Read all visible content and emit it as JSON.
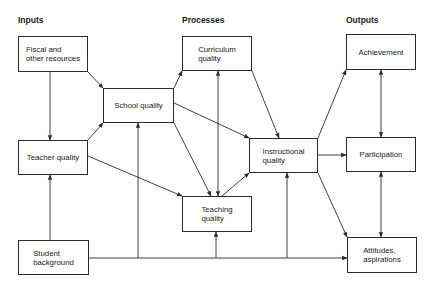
{
  "headers": {
    "inputs": "Inputs",
    "processes": "Processes",
    "outputs": "Outputs"
  },
  "nodes": {
    "fiscal": "Fiscal and\nother resources",
    "teacher_quality": "Teacher quality",
    "student_background": "Student\nbackground",
    "school_quality": "School quality",
    "curriculum_quality": "Curriculum\nquality",
    "teaching_quality": "Teaching\nquality",
    "instructional_quality": "Instructional\nquality",
    "achievement": "Achievement",
    "participation": "Participation",
    "attitudes": "Attitudes,\naspirations"
  },
  "edges": [
    {
      "from": "fiscal",
      "to": "teacher_quality"
    },
    {
      "from": "fiscal",
      "to": "school_quality"
    },
    {
      "from": "teacher_quality",
      "to": "school_quality"
    },
    {
      "from": "teacher_quality",
      "to": "teaching_quality"
    },
    {
      "from": "student_background",
      "to": "teacher_quality"
    },
    {
      "from": "student_background",
      "to": "school_quality"
    },
    {
      "from": "student_background",
      "to": "teaching_quality"
    },
    {
      "from": "student_background",
      "to": "instructional_quality"
    },
    {
      "from": "student_background",
      "to": "attitudes"
    },
    {
      "from": "school_quality",
      "to": "curriculum_quality"
    },
    {
      "from": "school_quality",
      "to": "instructional_quality"
    },
    {
      "from": "school_quality",
      "to": "teaching_quality"
    },
    {
      "from": "curriculum_quality",
      "to": "teaching_quality",
      "bidirectional": true
    },
    {
      "from": "curriculum_quality",
      "to": "instructional_quality"
    },
    {
      "from": "teaching_quality",
      "to": "instructional_quality"
    },
    {
      "from": "instructional_quality",
      "to": "achievement"
    },
    {
      "from": "instructional_quality",
      "to": "participation"
    },
    {
      "from": "instructional_quality",
      "to": "attitudes"
    },
    {
      "from": "achievement",
      "to": "participation",
      "bidirectional": true
    },
    {
      "from": "participation",
      "to": "attitudes",
      "bidirectional": true
    }
  ]
}
